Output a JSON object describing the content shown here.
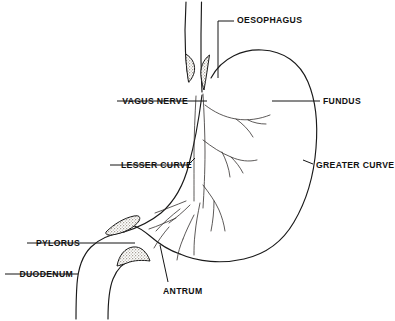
{
  "figure": {
    "background_color": "#ffffff",
    "line_color": "#1a1a1a",
    "stipple_color": "#b9b2a8"
  },
  "labels": [
    {
      "key": "oesophagus",
      "text": "OESOPHAGUS",
      "name": "label-oesophagus",
      "anchor": "left",
      "x": 237,
      "y": 16,
      "leader": "M 234 21 L 218 21 L 218 78"
    },
    {
      "key": "vagus_nerve",
      "text": "VAGUS NERVE",
      "name": "label-vagus-nerve",
      "anchor": "right",
      "x": 188,
      "y": 97,
      "leader": "M 117 101 L 207 101"
    },
    {
      "key": "fundus",
      "text": "FUNDUS",
      "name": "label-fundus",
      "anchor": "left",
      "x": 323,
      "y": 97,
      "leader": "M 320 101 L 272 101"
    },
    {
      "key": "lesser_curve",
      "text": "LESSER CURVE",
      "name": "label-lesser-curve",
      "anchor": "right",
      "x": 192,
      "y": 161,
      "leader": "M 110 165 L 188 165 L 195 158"
    },
    {
      "key": "greater_curve",
      "text": "GREATER CURVE",
      "name": "label-greater-curve",
      "anchor": "left",
      "x": 316,
      "y": 161,
      "leader": "M 313 164 L 303 160"
    },
    {
      "key": "pylorus",
      "text": "PYLORUS",
      "name": "label-pylorus",
      "anchor": "right",
      "x": 80,
      "y": 239,
      "leader": "M 27 243 L 135 243"
    },
    {
      "key": "duodenum",
      "text": "DUODENUM",
      "name": "label-duodenum",
      "anchor": "right",
      "x": 73,
      "y": 270,
      "leader": "M 5 274 L 78 274"
    },
    {
      "key": "antrum",
      "text": "ANTRUM",
      "name": "label-antrum",
      "anchor": "left",
      "x": 163,
      "y": 287,
      "leader": "M 168 282 L 160 245"
    }
  ],
  "structures": [
    {
      "key": "oesophagus_tube",
      "name": "oesophagus-tube"
    },
    {
      "key": "stomach_body",
      "name": "stomach-body-outline"
    },
    {
      "key": "lesser_curve_line",
      "name": "lesser-curve-outline"
    },
    {
      "key": "greater_curve_line",
      "name": "greater-curve-outline"
    },
    {
      "key": "duodenum_tube",
      "name": "duodenum-tube"
    },
    {
      "key": "cardiac_sphincter",
      "name": "cardiac-sphincter-stipple"
    },
    {
      "key": "pyloric_sphincter",
      "name": "pyloric-sphincter-stipple"
    },
    {
      "key": "vagal_plexus",
      "name": "vagus-nerve-branches"
    }
  ]
}
